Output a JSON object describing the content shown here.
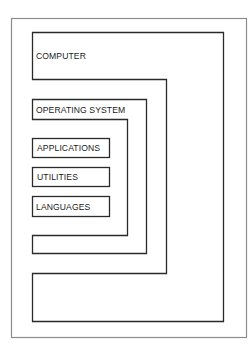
{
  "diagram": {
    "type": "nested-layers",
    "layers": [
      {
        "id": "computer",
        "label": "COMPUTER"
      },
      {
        "id": "operating-system",
        "label": "OPERATING SYSTEM"
      }
    ],
    "programs": [
      {
        "id": "applications",
        "label": "APPLICATIONS"
      },
      {
        "id": "utilities",
        "label": "UTILITIES"
      },
      {
        "id": "languages",
        "label": "LANGUAGES"
      }
    ],
    "colors": {
      "frame": "#8c8c8c",
      "line": "#2a2a2a",
      "text": "#1a1a1a",
      "background": "#ffffff"
    }
  }
}
